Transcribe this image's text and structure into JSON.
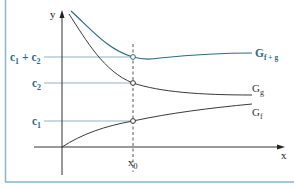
{
  "figure": {
    "axes": {
      "x_label": "x",
      "y_label": "y"
    },
    "marker": {
      "x_label": "x0",
      "x_label_base": "x",
      "x_label_sub": "0"
    },
    "levels": [
      {
        "id": "c1_plus_c2",
        "label": "c1 + c2",
        "parts": [
          "c",
          "1",
          " + c",
          "2"
        ]
      },
      {
        "id": "c2",
        "label": "c2",
        "parts": [
          "c",
          "2"
        ]
      },
      {
        "id": "c1",
        "label": "c1",
        "parts": [
          "c",
          "1"
        ]
      }
    ],
    "curves": [
      {
        "id": "G_f_plus_g",
        "label": "Gf+g",
        "base": "G",
        "sub": "f + g",
        "color": "#2e6a86"
      },
      {
        "id": "G_g",
        "label": "Gg",
        "base": "G",
        "sub": "g",
        "color": "#3a3a3a"
      },
      {
        "id": "G_f",
        "label": "Gf",
        "base": "G",
        "sub": "f",
        "color": "#3a3a3a"
      }
    ],
    "colors": {
      "accent": "#2e6a86",
      "border": "#86b6cc",
      "guide": "#8fb3c4",
      "axis": "#333333"
    }
  }
}
